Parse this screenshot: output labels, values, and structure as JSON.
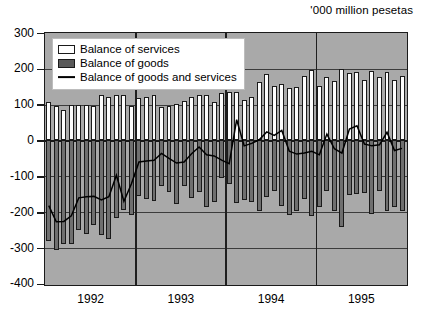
{
  "units_label": "'000 million pesetas",
  "legend": {
    "items": [
      {
        "label": "Balance of services",
        "swatch": "white-square-icon",
        "color": "#ffffff"
      },
      {
        "label": "Balance of goods",
        "swatch": "dark-square-icon",
        "color": "#595959"
      },
      {
        "label": "Balance of goods and services",
        "swatch": "line-icon",
        "color": "#000000"
      }
    ]
  },
  "colors": {
    "plot_background": "#a9a9a9",
    "services_bar": "#fdfdfd",
    "goods_bar": "#6f6f6f",
    "line": "#000000",
    "axis": "#1a1a1a",
    "gridline": "#3c3c3c",
    "legend_background": "#ffffff",
    "page_background": "#ffffff"
  },
  "chart_data": {
    "type": "bar",
    "title": "",
    "subtitle": "",
    "xlabel": "",
    "ylabel": "'000 million pesetas",
    "ylim": [
      -400,
      300
    ],
    "yticks": [
      300,
      200,
      100,
      0,
      -100,
      -200,
      -300,
      -400
    ],
    "ytick_labels": [
      "300",
      "200",
      "100",
      "0",
      "-100",
      "-200",
      "-300",
      "-400"
    ],
    "grid": true,
    "legend_position": "top-left",
    "stacked": true,
    "categories": [
      "1992-01",
      "1992-02",
      "1992-03",
      "1992-04",
      "1992-05",
      "1992-06",
      "1992-07",
      "1992-08",
      "1992-09",
      "1992-10",
      "1992-11",
      "1992-12",
      "1993-01",
      "1993-02",
      "1993-03",
      "1993-04",
      "1993-05",
      "1993-06",
      "1993-07",
      "1993-08",
      "1993-09",
      "1993-10",
      "1993-11",
      "1993-12",
      "1994-01",
      "1994-02",
      "1994-03",
      "1994-04",
      "1994-05",
      "1994-06",
      "1994-07",
      "1994-08",
      "1994-09",
      "1994-10",
      "1994-11",
      "1994-12",
      "1995-01",
      "1995-02",
      "1995-03",
      "1995-04",
      "1995-05",
      "1995-06",
      "1995-07",
      "1995-08",
      "1995-09",
      "1995-10",
      "1995-11",
      "1995-12"
    ],
    "x": [
      "1992",
      "1993",
      "1994",
      "1995"
    ],
    "xtick_labels": [
      "1992",
      "1993",
      "1994",
      "1995"
    ],
    "year_boundaries": [
      0,
      12,
      24,
      36,
      48
    ],
    "series": [
      {
        "name": "Balance of services",
        "type": "bar",
        "color": "#fdfdfd",
        "values": [
          107,
          95,
          85,
          98,
          100,
          100,
          95,
          127,
          122,
          128,
          128,
          97,
          118,
          122,
          127,
          94,
          97,
          103,
          110,
          120,
          128,
          126,
          108,
          132,
          135,
          135,
          112,
          120,
          162,
          185,
          151,
          159,
          147,
          150,
          180,
          196,
          153,
          176,
          167,
          200,
          189,
          192,
          170,
          195,
          177,
          192,
          168,
          181
        ]
      },
      {
        "name": "Balance of goods",
        "type": "bar",
        "color": "#6f6f6f",
        "values": [
          -281,
          -305,
          -288,
          -289,
          -249,
          -262,
          -237,
          -263,
          -275,
          -216,
          -194,
          -209,
          -155,
          -163,
          -168,
          -127,
          -143,
          -178,
          -128,
          -161,
          -144,
          -187,
          -172,
          -106,
          -121,
          -174,
          -166,
          -172,
          -198,
          -158,
          -141,
          -182,
          -207,
          -197,
          -162,
          -211,
          -186,
          -141,
          -196,
          -242,
          -151,
          -150,
          -147,
          -205,
          -142,
          -196,
          -185,
          -196
        ]
      },
      {
        "name": "Balance of goods and services",
        "type": "line",
        "color": "#000000",
        "values": [
          -182,
          -227,
          -226,
          -210,
          -160,
          -157,
          -156,
          -166,
          -157,
          -97,
          -170,
          -121,
          -60,
          -57,
          -55,
          -36,
          -50,
          -63,
          -60,
          -37,
          -18,
          -40,
          -43,
          -55,
          -65,
          58,
          -15,
          -8,
          2,
          24,
          14,
          28,
          -30,
          -38,
          -35,
          -30,
          -40,
          18,
          -23,
          -35,
          32,
          41,
          -10,
          -15,
          -12,
          23,
          -28,
          -22
        ]
      }
    ]
  }
}
